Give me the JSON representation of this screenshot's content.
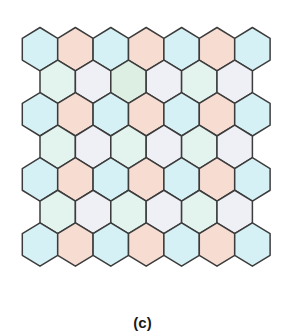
{
  "figure": {
    "caption": "(c)"
  },
  "colors": {
    "cyan": "#d6f1f5",
    "pink": "#f7dcd2",
    "mint": "#e3f3ee",
    "lavender": "#efeff6",
    "mint_smudge": "#dcefe2",
    "stroke": "#3c3c3c"
  },
  "grid": {
    "rows": [
      {
        "type": "full",
        "cells": [
          "cyan",
          "pink",
          "cyan",
          "pink",
          "cyan",
          "pink",
          "cyan"
        ]
      },
      {
        "type": "offset",
        "cells": [
          "mint",
          "lavender",
          "mint_smudge",
          "lavender",
          "mint",
          "lavender"
        ]
      },
      {
        "type": "full",
        "cells": [
          "cyan",
          "pink",
          "cyan",
          "pink",
          "cyan",
          "pink",
          "cyan"
        ]
      },
      {
        "type": "offset",
        "cells": [
          "mint",
          "lavender",
          "mint",
          "lavender",
          "mint",
          "lavender"
        ]
      },
      {
        "type": "full",
        "cells": [
          "cyan",
          "pink",
          "cyan",
          "pink",
          "cyan",
          "pink",
          "cyan"
        ]
      },
      {
        "type": "offset",
        "cells": [
          "mint",
          "lavender",
          "mint",
          "lavender",
          "mint",
          "lavender"
        ]
      },
      {
        "type": "full",
        "cells": [
          "cyan",
          "pink",
          "cyan",
          "pink",
          "cyan",
          "pink",
          "cyan"
        ]
      }
    ]
  }
}
